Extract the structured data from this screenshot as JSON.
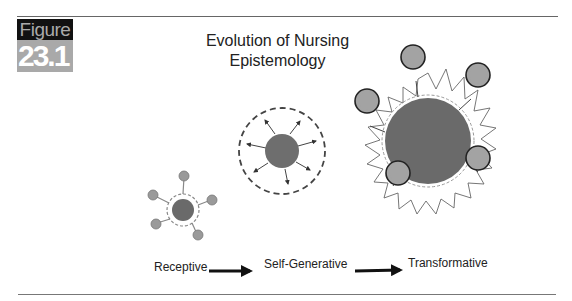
{
  "figure": {
    "label": "Figure",
    "number": "23.1",
    "title_line1": "Evolution of Nursing",
    "title_line2": "Epistemology"
  },
  "stages": [
    {
      "label": "Receptive"
    },
    {
      "label": "Self-Generative"
    },
    {
      "label": "Transformative"
    }
  ],
  "colors": {
    "core": "#6e6e6e",
    "satellite": "#a3a3a3",
    "label_bg": "#111111",
    "number_bg": "#a9a9a9"
  }
}
